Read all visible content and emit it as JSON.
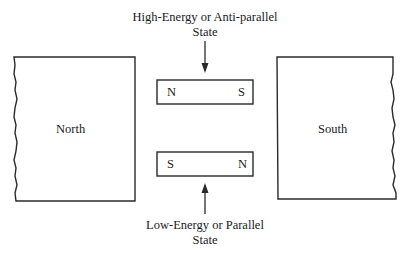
{
  "diagram": {
    "type": "magnetic-dipole-alignment",
    "top_caption": {
      "line1": "High-Energy or Anti-parallel",
      "line2": "State"
    },
    "bottom_caption": {
      "line1": "Low-Energy or Parallel",
      "line2": "State"
    },
    "large_magnets": [
      {
        "label": "North",
        "position": "left"
      },
      {
        "label": "South",
        "position": "right"
      }
    ],
    "small_magnets": [
      {
        "state": "anti-parallel",
        "left_pole": "N",
        "right_pole": "S"
      },
      {
        "state": "parallel",
        "left_pole": "S",
        "right_pole": "N"
      }
    ],
    "arrows": [
      {
        "direction": "down",
        "target": "anti-parallel magnet"
      },
      {
        "direction": "up",
        "target": "parallel magnet"
      }
    ],
    "colors": {
      "line": "#2a2a2a",
      "background": "#ffffff",
      "text": "#1a1a1a"
    }
  }
}
